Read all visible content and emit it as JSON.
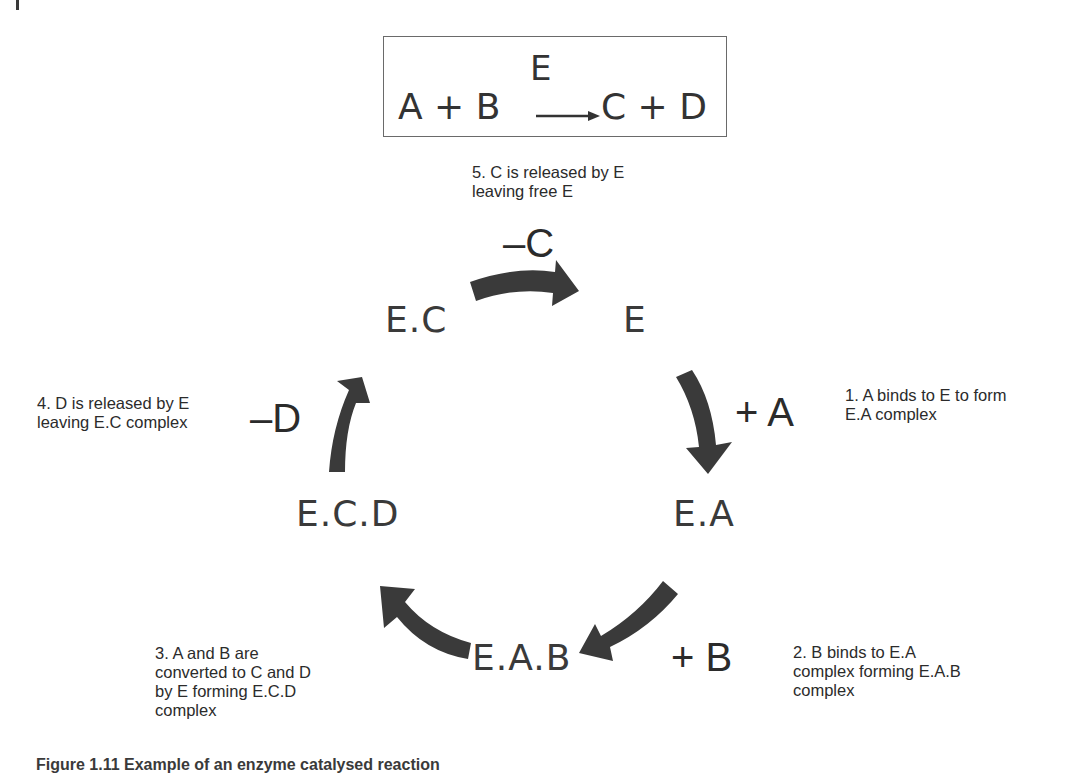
{
  "figure": {
    "caption": "Figure 1.11   Example of an enzyme catalysed reaction",
    "arrow_color": "#3a3a3a",
    "text_color": "#2b2b2b"
  },
  "reaction": {
    "lhs": "A + B",
    "enzyme": "E",
    "rhs": "C + D",
    "arrow_icon": "long-right-arrow"
  },
  "cycle": {
    "species": {
      "e": "E",
      "ea": "E.A",
      "eab": "E.A.B",
      "ecd": "E.C.D",
      "ec": "E.C"
    },
    "modifiers": {
      "plus_a": "+ A",
      "plus_b": "+ B",
      "minus_d": "–D",
      "minus_c": "–C"
    },
    "steps": [
      {
        "number": 1,
        "text": "1. A binds to E to form\nE.A complex"
      },
      {
        "number": 2,
        "text": "2. B binds to  E.A\ncomplex forming E.A.B\ncomplex"
      },
      {
        "number": 3,
        "text": "3. A and B are\nconverted to C and D\nby E forming E.C.D\ncomplex"
      },
      {
        "number": 4,
        "text": "4. D is released by E\nleaving E.C complex"
      },
      {
        "number": 5,
        "text": "5. C is released by E\nleaving free E"
      }
    ],
    "arrows": [
      {
        "from": "E",
        "to": "E.A",
        "icon": "curved-arrow-down"
      },
      {
        "from": "E.A",
        "to": "E.A.B",
        "icon": "curved-arrow-down-left"
      },
      {
        "from": "E.A.B",
        "to": "E.C.D",
        "icon": "curved-arrow-up-left"
      },
      {
        "from": "E.C.D",
        "to": "E.C",
        "icon": "curved-arrow-up"
      },
      {
        "from": "E.C",
        "to": "E",
        "icon": "curved-arrow-right"
      }
    ]
  }
}
